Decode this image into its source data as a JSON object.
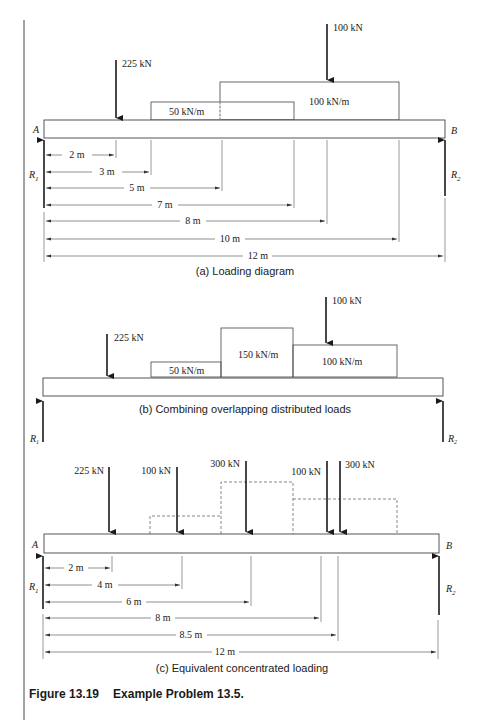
{
  "figure": {
    "number": "Figure 13.19",
    "title": "Example Problem 13.5."
  },
  "panel_a": {
    "caption": "(a) Loading diagram",
    "support_left": "A",
    "support_right": "B",
    "reaction_left": "R",
    "reaction_left_sub": "1",
    "reaction_right": "R",
    "reaction_right_sub": "2",
    "point_loads": [
      {
        "label": "225 kN",
        "position_m": 2
      },
      {
        "label": "100 kN",
        "position_m": 8
      }
    ],
    "distributed_loads": [
      {
        "label": "50 kN/m",
        "from_m": 3,
        "to_m": 7
      },
      {
        "label": "100 kN/m",
        "from_m": 5,
        "to_m": 10
      }
    ],
    "dimensions": [
      "2 m",
      "3 m",
      "5 m",
      "7 m",
      "8 m",
      "10 m",
      "12 m"
    ]
  },
  "panel_b": {
    "caption": "(b) Combining overlapping distributed loads",
    "reaction_left": "R",
    "reaction_left_sub": "1",
    "reaction_right": "R",
    "reaction_right_sub": "2",
    "point_loads": [
      {
        "label": "225 kN",
        "position_m": 2
      },
      {
        "label": "100 kN",
        "position_m": 8
      }
    ],
    "distributed_loads": [
      {
        "label": "50 kN/m",
        "from_m": 3,
        "to_m": 5
      },
      {
        "label": "150 kN/m",
        "from_m": 5,
        "to_m": 7
      },
      {
        "label": "100 kN/m",
        "from_m": 7,
        "to_m": 10
      }
    ]
  },
  "panel_c": {
    "caption": "(c) Equivalent concentrated loading",
    "support_left": "A",
    "support_right": "B",
    "reaction_left": "R",
    "reaction_left_sub": "1",
    "reaction_right": "R",
    "reaction_right_sub": "2",
    "point_loads": [
      {
        "label": "225 kN",
        "position_m": 2
      },
      {
        "label": "100 kN",
        "position_m": 4
      },
      {
        "label": "300 kN",
        "position_m": 6
      },
      {
        "label": "100 kN",
        "position_m": 8
      },
      {
        "label": "300 kN",
        "position_m": 8.5
      }
    ],
    "dimensions": [
      "2 m",
      "4 m",
      "6 m",
      "8 m",
      "8.5 m",
      "12 m"
    ]
  },
  "colors": {
    "ink": "#1a1a1a",
    "line": "#333333",
    "background": "#ffffff"
  }
}
